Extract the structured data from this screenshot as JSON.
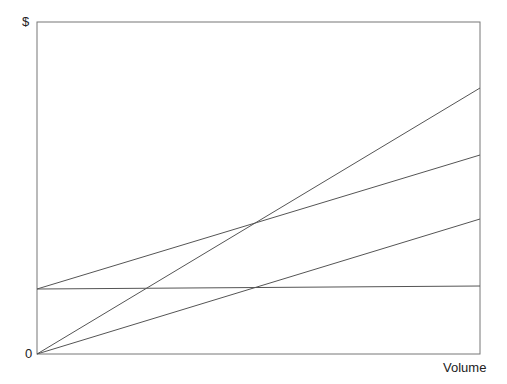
{
  "chart_data": {
    "type": "line",
    "title": "",
    "xlabel": "Volume",
    "ylabel": "$",
    "origin_label": "0",
    "grid": false,
    "legend": "none",
    "x": [
      0,
      1
    ],
    "xlim": [
      0,
      1
    ],
    "ylim": [
      0,
      332
    ],
    "series": [
      {
        "name": "Fixed cost",
        "values": [
          65,
          68
        ]
      },
      {
        "name": "Total cost",
        "values": [
          65,
          199
        ]
      },
      {
        "name": "Revenue",
        "values": [
          0,
          266
        ]
      },
      {
        "name": "Variable cost",
        "values": [
          0,
          135
        ]
      }
    ],
    "line_color": "#555555",
    "plot_box": {
      "left": 37,
      "top": 22,
      "right": 480,
      "bottom": 354
    }
  }
}
